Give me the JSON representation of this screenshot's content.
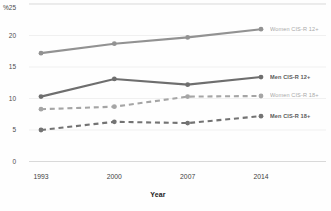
{
  "chart": {
    "percent_symbol": "%",
    "x_axis_label": "Year"
  },
  "chart_data": {
    "type": "line",
    "x": [
      "1993",
      "2000",
      "2007",
      "2014"
    ],
    "series": [
      {
        "name": "Women CIS-R 12+",
        "values": [
          17.2,
          18.7,
          19.7,
          21.0
        ],
        "dashed": false,
        "color": "#929292",
        "label_color": "#a9a9a9",
        "label_bold": false
      },
      {
        "name": "Men CIS-R 12+",
        "values": [
          10.3,
          13.1,
          12.2,
          13.4
        ],
        "dashed": false,
        "color": "#6e6e6e",
        "label_color": "#5a5a5a",
        "label_bold": true
      },
      {
        "name": "Women CIS-R 18+",
        "values": [
          8.3,
          8.7,
          10.3,
          10.4
        ],
        "dashed": true,
        "color": "#a5a5a5",
        "label_color": "#a9a9a9",
        "label_bold": false
      },
      {
        "name": "Men CIS-R 18+",
        "values": [
          5.0,
          6.3,
          6.1,
          7.2
        ],
        "dashed": true,
        "color": "#737373",
        "label_color": "#5a5a5a",
        "label_bold": true
      }
    ],
    "title": "",
    "xlabel": "Year",
    "ylabel": "%",
    "ylim": [
      0,
      25
    ],
    "yticks": [
      0,
      5,
      10,
      15,
      20,
      25
    ],
    "grid": true,
    "legend_position": "right-end-labels"
  }
}
